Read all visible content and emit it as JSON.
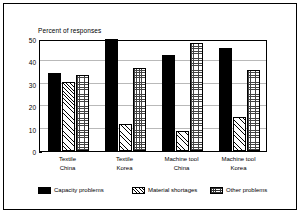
{
  "chart_data": {
    "type": "bar",
    "title": "Percent of responses",
    "xlabel": "",
    "ylabel": "",
    "ylim": [
      0,
      50
    ],
    "yticks": [
      0,
      10,
      20,
      30,
      40,
      50
    ],
    "grid": true,
    "legend_position": "bottom",
    "categories": [
      "Textile\nChina",
      "Textile\nKorea",
      "Machine tool\nChina",
      "Machine tool\nKorea"
    ],
    "category_lines": [
      [
        "Textile",
        "China"
      ],
      [
        "Textile",
        "Korea"
      ],
      [
        "Machine tool",
        "China"
      ],
      [
        "Machine tool",
        "Korea"
      ]
    ],
    "series": [
      {
        "name": "Capacity problems",
        "fill": "solid-black",
        "color": "#000000",
        "values": [
          35,
          50,
          43,
          46
        ]
      },
      {
        "name": "Material shortages",
        "fill": "diagonal-hatch",
        "color": "#ffffff",
        "values": [
          31,
          12,
          9,
          15
        ]
      },
      {
        "name": "Other problems",
        "fill": "cross-hatch",
        "color": "#ffffff",
        "values": [
          34,
          37,
          48,
          36
        ]
      }
    ]
  },
  "legend": {
    "items": [
      {
        "label": "Capacity problems"
      },
      {
        "label": "Material shortages"
      },
      {
        "label": "Other problems"
      }
    ]
  }
}
